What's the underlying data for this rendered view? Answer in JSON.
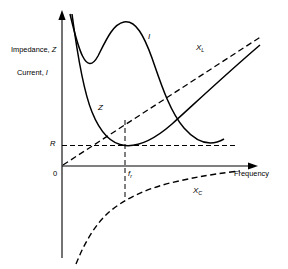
{
  "figure": {
    "title": "",
    "background_color": "#ffffff",
    "line_color": "#000000"
  },
  "axes": {
    "y_labels": [
      {
        "id": "impedance",
        "text": "Impedance, Z",
        "italic_part": "Z"
      },
      {
        "id": "current",
        "text": "Current, I",
        "italic_part": "I"
      }
    ],
    "x_label": "Frequency",
    "origin_label": "0",
    "y_tick_label": "R",
    "x_tick_label": "f",
    "x_tick_subscript": "r"
  },
  "curve_labels": [
    {
      "id": "current-curve-label",
      "text": "I",
      "sub": ""
    },
    {
      "id": "impedance-curve-label",
      "text": "Z",
      "sub": ""
    },
    {
      "id": "inductive-reactance-label",
      "text": "X",
      "sub": "L"
    },
    {
      "id": "capacitive-reactance-label",
      "text": "X",
      "sub": "C"
    }
  ],
  "chart_data": {
    "type": "line",
    "xlabel": "Frequency",
    "ylabel": "Impedance, Z / Current, I",
    "grid": false,
    "legend": "inline-curve-labels",
    "xlim": [
      0,
      1
    ],
    "ylim": [
      -1,
      1
    ],
    "annotations": [
      {
        "text": "0",
        "role": "origin",
        "x": 0,
        "y": 0
      },
      {
        "text": "R",
        "role": "y-axis-tick",
        "x": 0,
        "y": 0.12
      },
      {
        "text": "f_r",
        "role": "x-axis-tick",
        "x": 0.32,
        "y": 0
      },
      {
        "text": "Frequency",
        "role": "x-axis-title",
        "x": 0.95,
        "y": 0
      },
      {
        "text": "Impedance, Z",
        "role": "y-axis-title-line1",
        "x": 0,
        "y": 0.78
      },
      {
        "text": "Current, I",
        "role": "y-axis-title-line2",
        "x": 0,
        "y": 0.6
      }
    ],
    "reference_lines": [
      {
        "name": "R-level",
        "orientation": "horizontal",
        "value": 0.12,
        "style": "dashed"
      },
      {
        "name": "resonant-frequency",
        "orientation": "vertical",
        "value": 0.32,
        "style": "dashed"
      }
    ],
    "series": [
      {
        "name": "Z",
        "label": "Z",
        "style": "solid",
        "description": "Impedance magnitude; falls steeply from high values, reaches minimum R at resonant frequency f_r, then rises asymptotically toward X_L",
        "x": [
          0.05,
          0.08,
          0.12,
          0.16,
          0.2,
          0.24,
          0.28,
          0.32,
          0.36,
          0.42,
          0.5,
          0.6,
          0.72,
          0.85,
          1.0
        ],
        "y": [
          1.0,
          0.86,
          0.66,
          0.5,
          0.36,
          0.25,
          0.17,
          0.12,
          0.14,
          0.2,
          0.3,
          0.43,
          0.58,
          0.72,
          0.88
        ]
      },
      {
        "name": "I",
        "label": "I",
        "style": "solid",
        "description": "Current; rises to a maximum at resonant frequency f_r then decays",
        "x": [
          0.05,
          0.1,
          0.15,
          0.2,
          0.26,
          0.32,
          0.38,
          0.45,
          0.55,
          0.65,
          0.78,
          0.92,
          1.0
        ],
        "y": [
          0.12,
          0.38,
          0.7,
          0.92,
          1.02,
          1.03,
          0.96,
          0.82,
          0.6,
          0.42,
          0.27,
          0.17,
          0.13
        ]
      },
      {
        "name": "X_L",
        "label": "X_L",
        "style": "dashed",
        "description": "Inductive reactance; straight line rising linearly with frequency from the origin",
        "x": [
          0.0,
          1.0
        ],
        "y": [
          0.0,
          1.0
        ]
      },
      {
        "name": "X_C",
        "label": "X_C",
        "style": "dashed",
        "description": "Capacitive reactance; negative, large magnitude at low frequency approaching zero as frequency increases",
        "x": [
          0.08,
          0.12,
          0.16,
          0.22,
          0.3,
          0.4,
          0.52,
          0.66,
          0.82,
          0.95
        ],
        "y": [
          -0.95,
          -0.72,
          -0.58,
          -0.45,
          -0.34,
          -0.26,
          -0.19,
          -0.14,
          -0.1,
          -0.07
        ]
      }
    ]
  }
}
